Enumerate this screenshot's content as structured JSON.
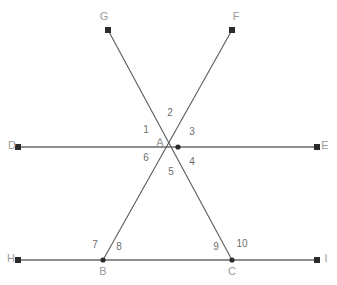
{
  "figure": {
    "colors": {
      "line": "#5a5a5a",
      "point_label": "#9a9a9a",
      "angle_label": "#6e6e6e",
      "vertex_dot": "#2b2b2b",
      "background": "#ffffff"
    },
    "points": [
      {
        "id": "G",
        "label": "G",
        "x": 108,
        "y": 30,
        "label_x": 104,
        "label_y": 17,
        "kind": "ray-endpoint"
      },
      {
        "id": "F",
        "label": "F",
        "x": 232,
        "y": 30,
        "label_x": 236,
        "label_y": 17,
        "kind": "ray-endpoint"
      },
      {
        "id": "D",
        "label": "D",
        "x": 18,
        "y": 147,
        "label_x": 12,
        "label_y": 146,
        "kind": "ray-endpoint"
      },
      {
        "id": "E",
        "label": "E",
        "x": 318,
        "y": 147,
        "label_x": 325,
        "label_y": 146,
        "kind": "ray-endpoint"
      },
      {
        "id": "A",
        "label": "A",
        "x": 178,
        "y": 147,
        "label_x": 160,
        "label_y": 143,
        "kind": "intersection"
      },
      {
        "id": "H",
        "label": "H",
        "x": 18,
        "y": 260,
        "label_x": 11,
        "label_y": 259,
        "kind": "ray-endpoint"
      },
      {
        "id": "I",
        "label": "I",
        "x": 318,
        "y": 260,
        "label_x": 326,
        "label_y": 259,
        "kind": "ray-endpoint"
      },
      {
        "id": "B",
        "label": "B",
        "x": 103,
        "y": 260,
        "label_x": 103,
        "label_y": 272,
        "kind": "intersection"
      },
      {
        "id": "C",
        "label": "C",
        "x": 232,
        "y": 260,
        "label_x": 232,
        "label_y": 272,
        "kind": "intersection"
      }
    ],
    "lines": [
      {
        "id": "line-DE",
        "name": "line-d-e",
        "from": "D",
        "to": "E",
        "arrow_start": true,
        "arrow_end": true
      },
      {
        "id": "line-HI",
        "name": "line-h-i",
        "from": "H",
        "to": "I",
        "arrow_start": true,
        "arrow_end": true
      },
      {
        "id": "line-GC",
        "name": "segment-g-c",
        "from": "G",
        "to": "C",
        "arrow_start": true,
        "arrow_end": false
      },
      {
        "id": "line-FB",
        "name": "segment-f-b",
        "from": "F",
        "to": "B",
        "arrow_start": true,
        "arrow_end": false
      }
    ],
    "angle_labels": [
      {
        "id": "1",
        "text": "1",
        "x": 146,
        "y": 130,
        "at_vertex": "A"
      },
      {
        "id": "2",
        "text": "2",
        "x": 170,
        "y": 113,
        "at_vertex": "A"
      },
      {
        "id": "3",
        "text": "3",
        "x": 192,
        "y": 132,
        "at_vertex": "A"
      },
      {
        "id": "4",
        "text": "4",
        "x": 192,
        "y": 162,
        "at_vertex": "A"
      },
      {
        "id": "5",
        "text": "5",
        "x": 171,
        "y": 172,
        "at_vertex": "A"
      },
      {
        "id": "6",
        "text": "6",
        "x": 146,
        "y": 158,
        "at_vertex": "A"
      },
      {
        "id": "7",
        "text": "7",
        "x": 95,
        "y": 245,
        "at_vertex": "B"
      },
      {
        "id": "8",
        "text": "8",
        "x": 119,
        "y": 247,
        "at_vertex": "B"
      },
      {
        "id": "9",
        "text": "9",
        "x": 216,
        "y": 247,
        "at_vertex": "C"
      },
      {
        "id": "10",
        "text": "10",
        "x": 242,
        "y": 244,
        "at_vertex": "C"
      }
    ]
  }
}
